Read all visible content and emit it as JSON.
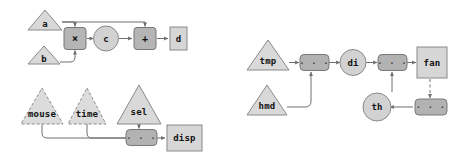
{
  "diagram": {
    "type": "dataflow-graph",
    "background_color": "#ffffff",
    "edge_color": "#6e6e6e",
    "panels": [
      {
        "id": "panel-left",
        "name": "left-panel",
        "subgraphs": [
          {
            "id": "subgraph-arith",
            "name": "arithmetic-graph",
            "nodes": [
              {
                "id": "a",
                "label": "a",
                "shape": "triangle",
                "style": "solid",
                "fill": "#d9d9d9"
              },
              {
                "id": "b",
                "label": "b",
                "shape": "triangle",
                "style": "solid",
                "fill": "#d9d9d9"
              },
              {
                "id": "mul",
                "label": "×",
                "shape": "rounded-box",
                "style": "dark",
                "fill": "#b5b5b5"
              },
              {
                "id": "c",
                "label": "c",
                "shape": "circle",
                "style": "light",
                "fill": "#d2d2d2"
              },
              {
                "id": "plus",
                "label": "+",
                "shape": "rounded-box",
                "style": "dark",
                "fill": "#b5b5b5"
              },
              {
                "id": "d",
                "label": "d",
                "shape": "box",
                "style": "light",
                "fill": "#d6d6d6"
              }
            ],
            "edges": [
              {
                "from": "a",
                "to": "mul",
                "style": "solid"
              },
              {
                "from": "a",
                "to": "plus",
                "style": "solid"
              },
              {
                "from": "b",
                "to": "mul",
                "style": "solid"
              },
              {
                "from": "mul",
                "to": "c",
                "style": "solid"
              },
              {
                "from": "c",
                "to": "plus",
                "style": "solid"
              },
              {
                "from": "plus",
                "to": "d",
                "style": "solid"
              }
            ]
          },
          {
            "id": "subgraph-ui",
            "name": "ui-graph",
            "nodes": [
              {
                "id": "mouse",
                "label": "mouse",
                "shape": "triangle",
                "style": "dashed",
                "fill": "#dcdcdc"
              },
              {
                "id": "time",
                "label": "time",
                "shape": "triangle",
                "style": "dashed",
                "fill": "#dcdcdc"
              },
              {
                "id": "sel",
                "label": "sel",
                "shape": "triangle",
                "style": "solid",
                "fill": "#d9d9d9"
              },
              {
                "id": "dots1",
                "label": "...",
                "shape": "rounded-box",
                "style": "dots",
                "fill": "#b2b2b2"
              },
              {
                "id": "disp",
                "label": "disp",
                "shape": "box",
                "style": "light",
                "fill": "#d6d6d6"
              }
            ],
            "edges": [
              {
                "from": "mouse",
                "to": "dots1",
                "style": "solid"
              },
              {
                "from": "time",
                "to": "dots1",
                "style": "solid"
              },
              {
                "from": "sel",
                "to": "dots1",
                "style": "solid"
              },
              {
                "from": "dots1",
                "to": "disp",
                "style": "solid"
              }
            ]
          }
        ]
      },
      {
        "id": "panel-right",
        "name": "right-panel",
        "subgraphs": [
          {
            "id": "subgraph-climate",
            "name": "climate-control-graph",
            "nodes": [
              {
                "id": "tmp",
                "label": "tmp",
                "shape": "triangle",
                "style": "solid",
                "fill": "#d9d9d9"
              },
              {
                "id": "hmd",
                "label": "hmd",
                "shape": "triangle",
                "style": "solid",
                "fill": "#d9d9d9"
              },
              {
                "id": "dots2",
                "label": "...",
                "shape": "rounded-box",
                "style": "dots",
                "fill": "#b2b2b2"
              },
              {
                "id": "di",
                "label": "di",
                "shape": "circle",
                "style": "light",
                "fill": "#d2d2d2"
              },
              {
                "id": "dots3",
                "label": "...",
                "shape": "rounded-box",
                "style": "dots",
                "fill": "#b2b2b2"
              },
              {
                "id": "fan",
                "label": "fan",
                "shape": "box",
                "style": "light",
                "fill": "#d6d6d6"
              },
              {
                "id": "th",
                "label": "th",
                "shape": "circle",
                "style": "light",
                "fill": "#d2d2d2"
              },
              {
                "id": "dots4",
                "label": "...",
                "shape": "rounded-box",
                "style": "dots",
                "fill": "#b2b2b2"
              }
            ],
            "edges": [
              {
                "from": "tmp",
                "to": "dots2",
                "style": "solid"
              },
              {
                "from": "hmd",
                "to": "dots2",
                "style": "solid"
              },
              {
                "from": "dots2",
                "to": "di",
                "style": "solid"
              },
              {
                "from": "di",
                "to": "dots3",
                "style": "solid"
              },
              {
                "from": "dots3",
                "to": "fan",
                "style": "solid"
              },
              {
                "from": "th",
                "to": "dots3",
                "style": "solid"
              },
              {
                "from": "fan",
                "to": "dots4",
                "style": "dashed"
              },
              {
                "from": "dots4",
                "to": "th",
                "style": "solid"
              }
            ]
          }
        ]
      }
    ],
    "labels": {
      "a": "a",
      "b": "b",
      "mul": "×",
      "c": "c",
      "plus": "+",
      "d": "d",
      "mouse": "mouse",
      "time": "time",
      "sel": "sel",
      "disp": "disp",
      "dots1": "· · ·",
      "tmp": "tmp",
      "hmd": "hmd",
      "dots2": "· · ·",
      "di": "di",
      "dots3": "· · ·",
      "fan": "fan",
      "th": "th",
      "dots4": "· · ·"
    }
  }
}
